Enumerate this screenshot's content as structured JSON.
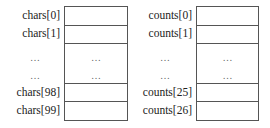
{
  "arrays": [
    {
      "name": "chars",
      "labels": [
        "chars[0]",
        "chars[1]",
        "…",
        "…",
        "chars[98]",
        "chars[99]"
      ],
      "cells": [
        "",
        "",
        "…",
        "…",
        "",
        ""
      ]
    },
    {
      "name": "counts",
      "labels": [
        "counts[0]",
        "counts[1]",
        "…",
        "…",
        "counts[25]",
        "counts[26]"
      ],
      "cells": [
        "",
        "",
        "…",
        "…",
        "",
        ""
      ]
    }
  ]
}
